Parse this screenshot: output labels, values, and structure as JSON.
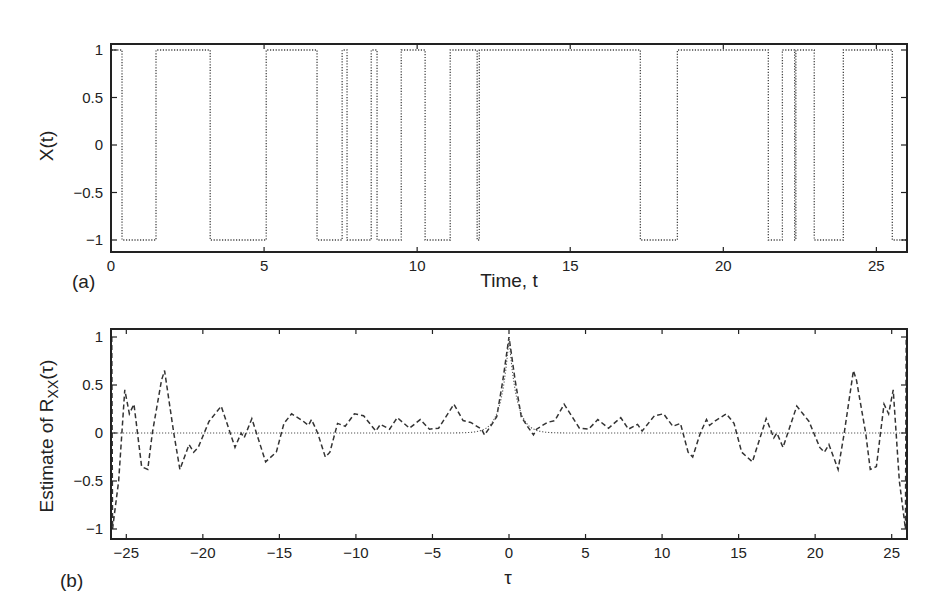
{
  "chart_data": [
    {
      "type": "line",
      "panel_label": "(a)",
      "title": "",
      "xlabel": "Time, t",
      "ylabel": "X(t)",
      "xlim": [
        0,
        26
      ],
      "ylim": [
        -1.1,
        1.1
      ],
      "xticks": [
        0,
        5,
        10,
        15,
        20,
        25
      ],
      "xtick_labels": [
        "0",
        "5",
        "10",
        "15",
        "20",
        "25"
      ],
      "yticks": [
        1,
        0.5,
        0,
        -0.5,
        -1
      ],
      "ytick_labels": [
        "1",
        "0.5",
        "0",
        "−0.5",
        "−1"
      ],
      "grid": false,
      "series": [
        {
          "name": "X(t) random telegraph signal",
          "style": "dotted",
          "initial_value": 1,
          "transitions_t": [
            0.36,
            1.47,
            3.24,
            5.07,
            6.73,
            7.55,
            7.71,
            8.5,
            8.69,
            9.48,
            10.26,
            11.08,
            11.96,
            12.03,
            17.29,
            18.5,
            21.47,
            21.93,
            22.33,
            22.37,
            22.97,
            23.92,
            25.52
          ],
          "end_t": 26
        }
      ]
    },
    {
      "type": "line",
      "panel_label": "(b)",
      "title": "",
      "xlabel": "τ",
      "ylabel": "Estimate of R",
      "ylabel_sub": "XX",
      "ylabel_suffix": "(τ)",
      "xlim": [
        -26,
        26
      ],
      "ylim": [
        -1.1,
        1.1
      ],
      "xticks": [
        -25,
        -20,
        -15,
        -10,
        -5,
        0,
        5,
        10,
        15,
        20,
        25
      ],
      "xtick_labels": [
        "−25",
        "−20",
        "−15",
        "−10",
        "−5",
        "0",
        "5",
        "10",
        "15",
        "20",
        "25"
      ],
      "yticks": [
        1,
        0.5,
        0,
        -0.5,
        -1
      ],
      "ytick_labels": [
        "1",
        "0.5",
        "0",
        "−0.5",
        "−1"
      ],
      "grid": false,
      "symmetric": true,
      "series": [
        {
          "name": "Estimate of R_XX(tau)",
          "style": "dashed",
          "tau_positive": [
            0,
            0.4,
            0.8,
            1.2,
            1.6,
            1.8,
            2.5,
            3.0,
            3.6,
            4.6,
            5.2,
            5.8,
            6.5,
            7.3,
            7.8,
            8.4,
            8.7,
            9.5,
            10.1,
            10.7,
            11.2,
            11.7,
            12.0,
            12.5,
            12.9,
            13.1,
            13.5,
            14.2,
            14.7,
            15.2,
            15.9,
            16.8,
            17.3,
            17.5,
            17.9,
            18.8,
            19.2,
            19.6,
            20.3,
            20.6,
            20.9,
            21.5,
            21.9,
            22.5,
            22.7,
            23.3,
            23.6,
            24.0,
            24.5,
            24.8,
            25.1,
            25.5,
            25.9,
            26.0
          ],
          "values_positive": [
            1.0,
            0.55,
            0.17,
            0.07,
            -0.02,
            0.04,
            0.11,
            0.13,
            0.3,
            0.05,
            0.04,
            0.14,
            0.05,
            0.16,
            0.04,
            0.09,
            0.02,
            0.18,
            0.2,
            0.07,
            0.1,
            -0.2,
            -0.25,
            0.0,
            0.14,
            0.08,
            0.13,
            0.2,
            0.1,
            -0.2,
            -0.3,
            0.15,
            -0.05,
            0.0,
            -0.15,
            0.28,
            0.2,
            0.12,
            -0.15,
            -0.2,
            -0.12,
            -0.38,
            0.0,
            0.65,
            0.55,
            0.0,
            -0.38,
            -0.35,
            0.3,
            0.2,
            0.45,
            -0.5,
            -1.0,
            1.0
          ]
        },
        {
          "name": "True R_XX(tau)",
          "style": "dotted",
          "description": "near-zero baseline with sharp exponential peak at tau=0",
          "decay_rate": 2.0
        }
      ]
    }
  ]
}
